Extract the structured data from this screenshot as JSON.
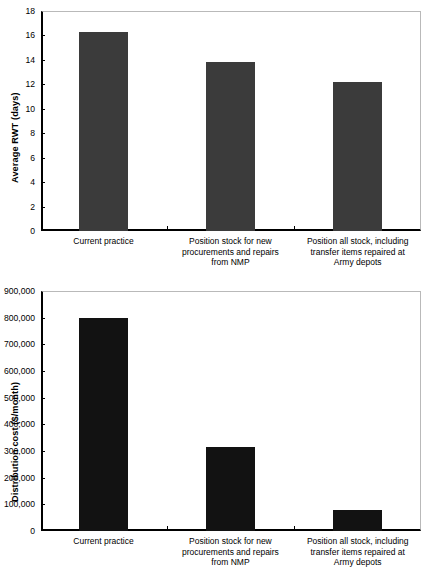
{
  "chart_data": [
    {
      "id": "average-rwt",
      "type": "bar",
      "title": "",
      "xlabel": "",
      "ylabel": "Average RWT (days)",
      "categories": [
        "Current practice",
        "Position stock for new procurements and repairs from NMP",
        "Position all stock, including transfer items repaired at Army depots"
      ],
      "category_lines": [
        [
          "Current practice"
        ],
        [
          "Position stock for new",
          "procurements and repairs",
          "from NMP"
        ],
        [
          "Position all stock, including",
          "transfer items repaired at",
          "Army depots"
        ]
      ],
      "values": [
        16.3,
        13.8,
        12.2
      ],
      "ylim": [
        0,
        18
      ],
      "ytick_step": 2,
      "ytick_labels": [
        "18",
        "16",
        "14",
        "12",
        "10",
        "8",
        "6",
        "4",
        "2",
        "0"
      ],
      "ytick_values": [
        18,
        16,
        14,
        12,
        10,
        8,
        6,
        4,
        2,
        0
      ],
      "bar_color": "#3b3b3b",
      "grid": false,
      "legend": "none"
    },
    {
      "id": "distribution-cost",
      "type": "bar",
      "title": "",
      "xlabel": "",
      "ylabel": "Distribution cost ($/month)",
      "categories": [
        "Current practice",
        "Position stock for new procurements and repairs from NMP",
        "Position all stock, including transfer items repaired at Army depots"
      ],
      "category_lines": [
        [
          "Current practice"
        ],
        [
          "Position stock for new",
          "procurements and repairs",
          "from NMP"
        ],
        [
          "Position all stock, including",
          "transfer items repaired at",
          "Army depots"
        ]
      ],
      "values": [
        800000,
        315000,
        80000
      ],
      "ylim": [
        0,
        900000
      ],
      "ytick_step": 100000,
      "ytick_labels": [
        "900,000",
        "800,000",
        "700,000",
        "600,000",
        "500,000",
        "400,000",
        "300,000",
        "200,000",
        "100,000",
        "0"
      ],
      "ytick_values": [
        900000,
        800000,
        700000,
        600000,
        500000,
        400000,
        300000,
        200000,
        100000,
        0
      ],
      "bar_color": "#121212",
      "grid": false,
      "legend": "none"
    }
  ]
}
